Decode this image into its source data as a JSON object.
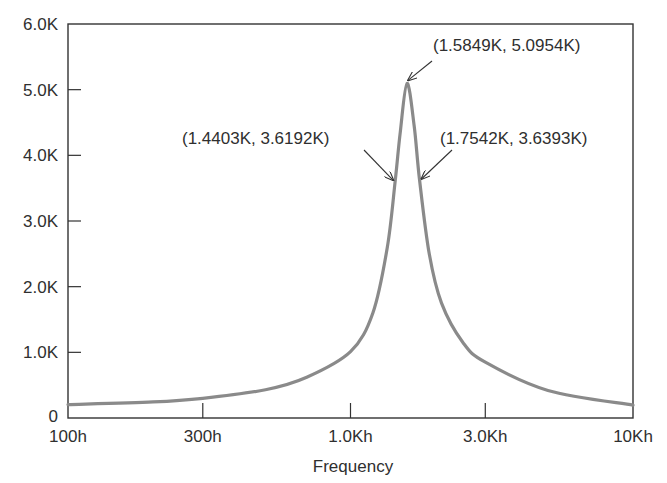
{
  "chart_data": {
    "type": "line",
    "title": "",
    "xlabel": "Frequency",
    "ylabel": "",
    "xscale": "log",
    "xlim": [
      100,
      10000
    ],
    "ylim": [
      0,
      6000
    ],
    "grid": false,
    "legend": null,
    "x_ticks": [
      {
        "value": 100,
        "label": "100h"
      },
      {
        "value": 300,
        "label": "300h"
      },
      {
        "value": 1000,
        "label": "1.0Kh"
      },
      {
        "value": 3000,
        "label": "3.0Kh"
      },
      {
        "value": 10000,
        "label": "10Kh"
      }
    ],
    "y_ticks": [
      {
        "value": 0,
        "label": "0"
      },
      {
        "value": 1000,
        "label": "1.0K"
      },
      {
        "value": 2000,
        "label": "2.0K"
      },
      {
        "value": 3000,
        "label": "3.0K"
      },
      {
        "value": 4000,
        "label": "4.0K"
      },
      {
        "value": 5000,
        "label": "5.0K"
      },
      {
        "value": 6000,
        "label": "6.0K"
      }
    ],
    "series": [
      {
        "name": "response",
        "color": "#8a8a8a",
        "x": [
          100,
          200,
          300,
          500,
          700,
          1000,
          1200,
          1350,
          1440.3,
          1500,
          1584.9,
          1680,
          1754.2,
          1900,
          2100,
          2500,
          3000,
          5000,
          10000
        ],
        "values": [
          205,
          245,
          300,
          430,
          620,
          1010,
          1600,
          2600,
          3619.2,
          4350,
          5095.4,
          4450,
          3639.3,
          2500,
          1750,
          1150,
          850,
          420,
          195
        ]
      }
    ],
    "annotations": [
      {
        "x": 1584.9,
        "y": 5095.4,
        "label": "(1.5849K, 5.0954K)"
      },
      {
        "x": 1440.3,
        "y": 3619.2,
        "label": "(1.4403K, 3.6192K)"
      },
      {
        "x": 1754.2,
        "y": 3639.3,
        "label": "(1.7542K, 3.6393K)"
      }
    ]
  },
  "colors": {
    "axis": "#333333",
    "curve": "#8a8a8a",
    "text": "#2f2f2f",
    "background": "#ffffff"
  }
}
